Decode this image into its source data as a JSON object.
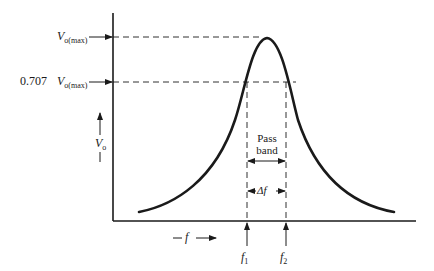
{
  "diagram": {
    "title": "",
    "y_axis": {
      "label": "V",
      "label_sub": "o"
    },
    "x_axis": {
      "label": "f"
    },
    "levels": [
      {
        "name": "max",
        "prefix": "",
        "symbol": "V",
        "sub": "o(max)"
      },
      {
        "name": "half_power",
        "prefix": "0.707",
        "symbol": "V",
        "sub": "o(max)"
      }
    ],
    "frequencies": [
      {
        "symbol": "f",
        "sub": "1"
      },
      {
        "symbol": "f",
        "sub": "2"
      }
    ],
    "pass_band": {
      "line1": "Pass",
      "line2": "band"
    },
    "bandwidth": {
      "label": "Δf"
    },
    "colors": {
      "line": "#1a1a1a",
      "background": "#ffffff"
    }
  }
}
